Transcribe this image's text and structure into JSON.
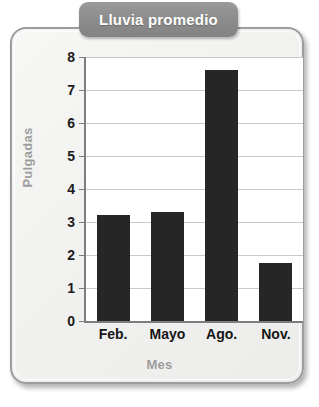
{
  "card": {
    "title_tab_label": "Lluvia promedio",
    "title_tab_color": "#8c8c8c",
    "background_color": "#f2f2f0",
    "border_color": "#9c9c9c"
  },
  "chart_data": {
    "type": "bar",
    "title": "Lluvia promedio",
    "xlabel": "Mes",
    "ylabel": "Pulgadas",
    "categories": [
      "Feb.",
      "Mayo",
      "Ago.",
      "Nov."
    ],
    "values": [
      3.2,
      3.3,
      7.6,
      1.75
    ],
    "ylim": [
      0,
      8
    ],
    "ytick_labels": [
      "0",
      "1",
      "2",
      "3",
      "4",
      "5",
      "6",
      "7",
      "8"
    ],
    "ytick_values": [
      0,
      1,
      2,
      3,
      4,
      5,
      6,
      7,
      8
    ],
    "grid": true,
    "legend": false,
    "bar_color": "#262626",
    "gridline_color": "#c9c9c9",
    "axis_color": "#7d7d7d",
    "axis_label_color": "#9d9d9d"
  }
}
